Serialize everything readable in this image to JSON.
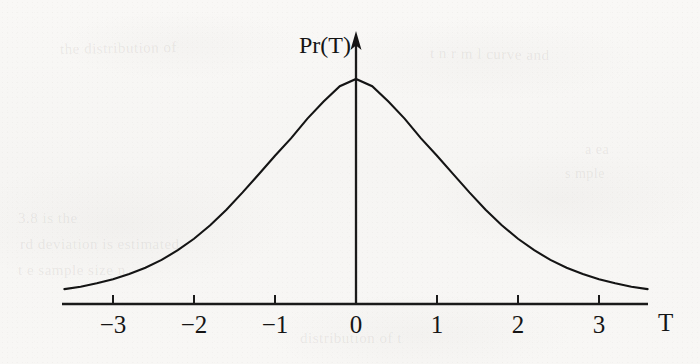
{
  "figure": {
    "kind": "scanned-textbook-figure",
    "paper_color": "#f7f6f4",
    "ink_color": "#141414",
    "y_axis_label": "Pr(T)",
    "x_axis_label": "T",
    "bleed_through_notes": "faint illegible text showing through from reverse page"
  },
  "bleed_text": [
    {
      "text": "the distribution of",
      "x": 60,
      "y": 40,
      "size": 15,
      "rot": -1
    },
    {
      "text": "t n  r  m  l  curve  and",
      "x": 430,
      "y": 46,
      "size": 15,
      "rot": 1
    },
    {
      "text": "a  ea",
      "x": 585,
      "y": 142,
      "size": 14,
      "rot": 0
    },
    {
      "text": "s  mple",
      "x": 565,
      "y": 166,
      "size": 14,
      "rot": 0
    },
    {
      "text": "3.8   is  the",
      "x": 18,
      "y": 210,
      "size": 15,
      "rot": 0
    },
    {
      "text": "rd   deviation  is  estimated",
      "x": 20,
      "y": 236,
      "size": 15,
      "rot": 0
    },
    {
      "text": "t  e  sample  size  n",
      "x": 18,
      "y": 262,
      "size": 15,
      "rot": 0
    },
    {
      "text": "distribution  of  t",
      "x": 300,
      "y": 330,
      "size": 15,
      "rot": 0
    }
  ],
  "chart_data": {
    "type": "line",
    "title": "",
    "subtitle": "",
    "xlabel": "T",
    "ylabel": "Pr(T)",
    "legend": [],
    "legend_position": "none",
    "grid": false,
    "annotations": [],
    "xlim": [
      -3.62,
      3.62
    ],
    "ylim": [
      0,
      1.06
    ],
    "xticks": [
      -3,
      -2,
      -1,
      0,
      1,
      2,
      3
    ],
    "xtick_labels": [
      "−3",
      "−2",
      "−1",
      "0",
      "1",
      "2",
      "3"
    ],
    "yticks": [],
    "ytick_labels": [],
    "peak": {
      "x": 0,
      "y": 1.0
    },
    "series": [
      {
        "name": "Pr(T)",
        "x": [
          -3.6,
          -3.4,
          -3.2,
          -3.0,
          -2.8,
          -2.6,
          -2.4,
          -2.2,
          -2.0,
          -1.8,
          -1.6,
          -1.4,
          -1.2,
          -1.0,
          -0.8,
          -0.6,
          -0.4,
          -0.2,
          0.0,
          0.2,
          0.4,
          0.6,
          0.8,
          1.0,
          1.2,
          1.4,
          1.6,
          1.8,
          2.0,
          2.2,
          2.4,
          2.6,
          2.8,
          3.0,
          3.2,
          3.4,
          3.6
        ],
        "y": [
          0.066,
          0.077,
          0.092,
          0.11,
          0.133,
          0.161,
          0.196,
          0.239,
          0.29,
          0.35,
          0.419,
          0.496,
          0.577,
          0.659,
          0.737,
          0.824,
          0.9,
          0.968,
          1.0,
          0.968,
          0.9,
          0.824,
          0.737,
          0.659,
          0.577,
          0.496,
          0.419,
          0.35,
          0.29,
          0.239,
          0.196,
          0.161,
          0.133,
          0.11,
          0.092,
          0.077,
          0.066
        ]
      }
    ]
  },
  "geometry": {
    "baseline_y": 304,
    "peak_y": 79,
    "axis_x_start": 62,
    "axis_x_end": 648,
    "vaxis_x": 356,
    "vaxis_top": 33,
    "px_per_unit": 81,
    "tick_length": 9
  }
}
